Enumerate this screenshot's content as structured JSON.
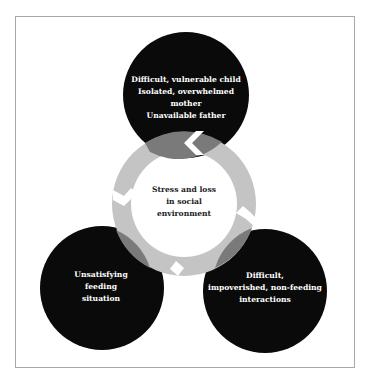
{
  "diagram": {
    "center": {
      "label": "Stress and loss\nin social\nenvironment"
    },
    "nodes": [
      {
        "id": "top",
        "label": "Difficult, vulnerable child\nIsolated, overwhelmed\nmother\nUnavailable father"
      },
      {
        "id": "bottom-left",
        "label": "Unsatisfying\nfeeding\nsituation"
      },
      {
        "id": "bottom-right",
        "label": "Difficult,\nimpoverished, non-feeding\ninteractions"
      }
    ],
    "colors": {
      "node": "#0a0a0a",
      "ring": "#c4c4c4",
      "overlap": "#7a7a7a",
      "frame": "#a8a8a8"
    }
  }
}
